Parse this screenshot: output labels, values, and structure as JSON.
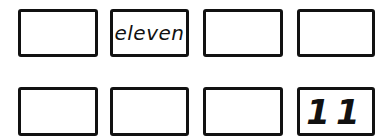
{
  "rows": [
    {
      "cells": [
        {
          "text": ""
        },
        {
          "text": "eleven",
          "kind": "word"
        },
        {
          "text": ""
        },
        {
          "text": ""
        }
      ]
    },
    {
      "cells": [
        {
          "text": ""
        },
        {
          "text": ""
        },
        {
          "text": ""
        },
        {
          "text": "11",
          "kind": "numeral"
        }
      ]
    }
  ]
}
